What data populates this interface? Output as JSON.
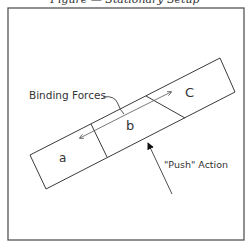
{
  "caption": "Figure — Stationary Setup",
  "diagram": {
    "labels": {
      "binding_forces": "Binding Forces",
      "push_action": "\"Push\" Action",
      "segment_a": "a",
      "segment_b": "b",
      "segment_c": "C"
    },
    "colors": {
      "stroke": "#3a3a3a",
      "frame": "#555555",
      "background": "#ffffff"
    }
  }
}
